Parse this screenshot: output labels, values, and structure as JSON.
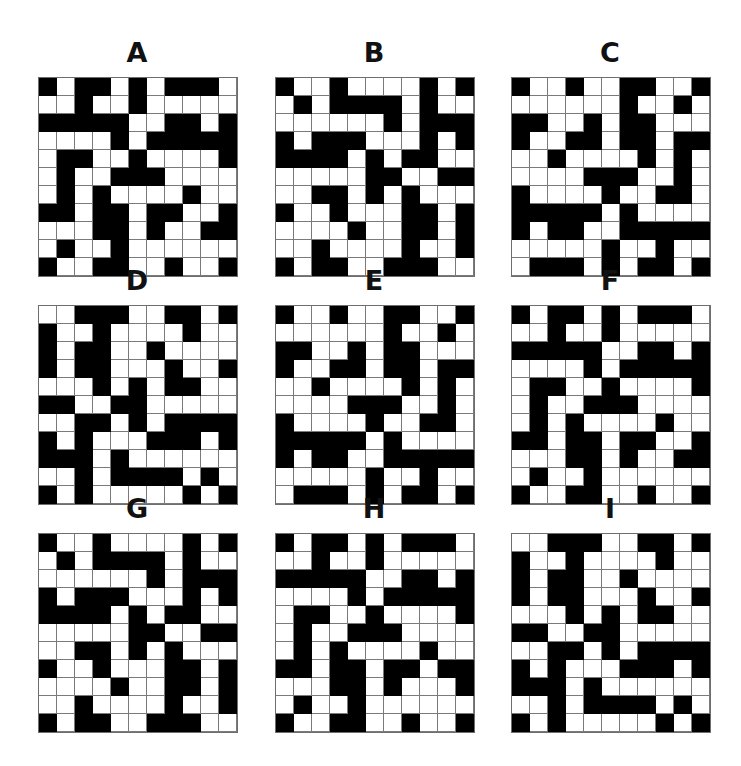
{
  "puzzle": {
    "grid_size": 11,
    "colors": {
      "filled": "#000000",
      "empty": "#ffffff",
      "gridline": "#7a7a7a"
    },
    "panels": [
      {
        "label": "A",
        "rows": [
          "10110101110",
          "00100100000",
          "11111001101",
          "00001011111",
          "01100100001",
          "01001110000",
          "01010000100",
          "11011011001",
          "00011010011",
          "01001000000",
          "10011001001"
        ]
      },
      {
        "label": "B",
        "rows": [
          "10010000101",
          "01011110100",
          "00000010111",
          "10111000101",
          "11110101100",
          "00000110011",
          "00110101000",
          "10010001101",
          "00001001101",
          "00100001001",
          "10110011100"
        ]
      },
      {
        "label": "C",
        "rows": [
          "10010011001",
          "00000010010",
          "11001011000",
          "10011011011",
          "00100001010",
          "00001110010",
          "10000100110",
          "11111010000",
          "10110011111",
          "00000100100",
          "01110101101"
        ]
      },
      {
        "label": "D",
        "rows": [
          "00111001101",
          "10010000100",
          "10110010000",
          "10110001001",
          "00010101100",
          "11001100000",
          "00110101111",
          "10100011101",
          "11101000000",
          "00101111010",
          "10100000101"
        ]
      },
      {
        "label": "E",
        "rows": [
          "10010011001",
          "00000010010",
          "11001011000",
          "10011011011",
          "00100001010",
          "00001110010",
          "10000100110",
          "11111010000",
          "10110011111",
          "00000100100",
          "01110101101"
        ]
      },
      {
        "label": "F",
        "rows": [
          "10110101110",
          "00100100000",
          "11111001101",
          "00001011111",
          "01100100001",
          "01001110000",
          "01010000100",
          "11011011001",
          "00011010011",
          "01001000000",
          "10011001001"
        ]
      },
      {
        "label": "G",
        "rows": [
          "10010000101",
          "01011110100",
          "00000010111",
          "10111000101",
          "11110101100",
          "00000110011",
          "00110101000",
          "10010001101",
          "00001001101",
          "00100001001",
          "10110011100"
        ]
      },
      {
        "label": "H",
        "rows": [
          "10110101110",
          "00100100000",
          "11111001101",
          "00001011111",
          "01100100001",
          "01001110000",
          "01010000100",
          "11011011011",
          "00011010001",
          "01001000000",
          "10011001001"
        ]
      },
      {
        "label": "I",
        "rows": [
          "00111001101",
          "10010000100",
          "10110010000",
          "10110001001",
          "00010101100",
          "11001100000",
          "00110101111",
          "10100011101",
          "11101000000",
          "00101111010",
          "10100000101"
        ]
      }
    ]
  }
}
